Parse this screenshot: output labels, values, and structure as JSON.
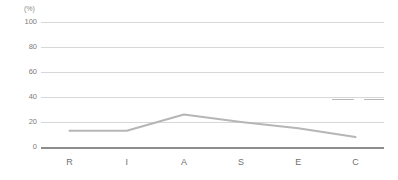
{
  "chart_data": {
    "type": "line",
    "title": "",
    "subtitle": "",
    "xlabel": "",
    "ylabel": "",
    "unit_label": "(%)",
    "categories": [
      "R",
      "I",
      "A",
      "S",
      "E",
      "C"
    ],
    "values": [
      13,
      13,
      26,
      20,
      15,
      8
    ],
    "series": [
      {
        "name": "",
        "values": [
          13,
          13,
          26,
          20,
          15,
          8
        ]
      }
    ],
    "ylim": [
      0,
      100
    ],
    "yticks": [
      100,
      80,
      60,
      40,
      20,
      0
    ],
    "ytick_labels": [
      "100",
      "80",
      "60",
      "40",
      "20",
      "0"
    ],
    "grid": true,
    "legend": "none",
    "line_color": "#b6b6b6",
    "grid_color": "#d8d8d8",
    "axis_color": "#8d8d8d",
    "tick_text_color": "#7d7d7d",
    "category_text_color": "#6f6f6f",
    "background_color": "#ffffff"
  }
}
